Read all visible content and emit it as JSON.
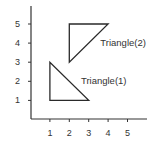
{
  "chart_data": {
    "type": "line",
    "title": "",
    "xlabel": "",
    "ylabel": "",
    "xlim": [
      0,
      6
    ],
    "ylim": [
      0,
      6
    ],
    "grid": false,
    "x_ticks": [
      1,
      2,
      3,
      4,
      5
    ],
    "y_ticks": [
      1,
      2,
      3,
      4,
      5
    ],
    "series": [
      {
        "name": "Triangle(1)",
        "closed": true,
        "points": [
          [
            1,
            3
          ],
          [
            1,
            1
          ],
          [
            3,
            1
          ]
        ],
        "label_position": [
          2.6,
          2.0
        ]
      },
      {
        "name": "Triangle(2)",
        "closed": true,
        "points": [
          [
            2,
            5
          ],
          [
            4,
            5
          ],
          [
            2,
            3
          ]
        ],
        "label_position": [
          3.6,
          4.0
        ]
      }
    ]
  },
  "colors": {
    "axis": "#333333",
    "stroke": "#2a2a2a",
    "text": "#333333",
    "background": "#ffffff"
  }
}
